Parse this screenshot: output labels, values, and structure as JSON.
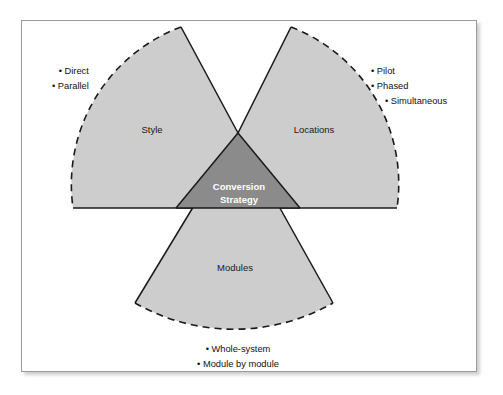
{
  "figure": {
    "title": "Conversion Strategy",
    "type": "three-wedge radial diagram",
    "core": {
      "label_line1": "Conversion",
      "label_line2": "Strategy",
      "fill_color": "#8b8b8b",
      "text_color": "#ffffff"
    },
    "wedge_fill_color": "#cdcdcd",
    "outline_color": "#1a1a1a",
    "frame_border_color": "#9a9a9a",
    "background_color": "#ffffff"
  },
  "wedges": [
    {
      "id": "style",
      "label": "Style",
      "position": "upper-left",
      "bullets": [
        "Direct",
        "Parallel"
      ]
    },
    {
      "id": "locations",
      "label": "Locations",
      "position": "upper-right",
      "bullets": [
        "Pilot",
        "Phased",
        "Simultaneous"
      ]
    },
    {
      "id": "modules",
      "label": "Modules",
      "position": "bottom",
      "bullets": [
        "Whole-system",
        "Module by module"
      ]
    }
  ],
  "bullet_marker": "•"
}
